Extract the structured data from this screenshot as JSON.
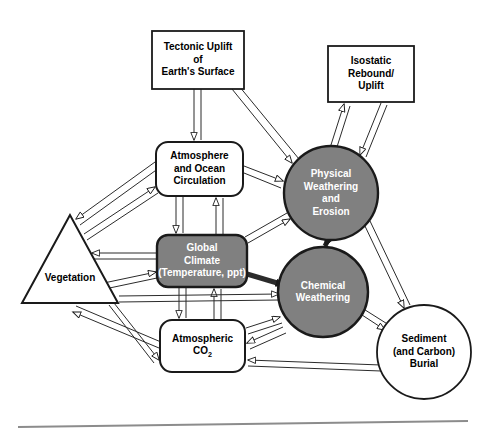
{
  "diagram": {
    "background_color": "#ffffff",
    "stroke_color": "#1a1a1a",
    "fill_shaded": "#808080",
    "fill_plain": "#ffffff",
    "text_light": "#ffffff",
    "text_dark": "#000000",
    "nodes": [
      {
        "id": "tectonic-uplift",
        "name": "tectonic-uplift-box",
        "shape": "rectangle",
        "fill": "#ffffff",
        "text": "Tectonic Uplift\nof\nEarth's Surface",
        "text_color": "#000000",
        "font_size": 10,
        "x": 152,
        "y": 31,
        "w": 92,
        "h": 58
      },
      {
        "id": "isostatic-rebound",
        "name": "isostatic-rebound-box",
        "shape": "rectangle",
        "fill": "#ffffff",
        "text": "Isostatic\nRebound/\nUplift",
        "text_color": "#000000",
        "font_size": 10,
        "x": 328,
        "y": 46,
        "w": 86,
        "h": 56
      },
      {
        "id": "atmosphere-ocean",
        "name": "atmosphere-ocean-circulation-box",
        "shape": "rounded-rectangle",
        "fill": "#ffffff",
        "text": "Atmosphere\nand Ocean\nCirculation",
        "text_color": "#000000",
        "font_size": 10,
        "x": 156,
        "y": 142,
        "w": 87,
        "h": 54
      },
      {
        "id": "global-climate",
        "name": "global-climate-box",
        "shape": "rounded-rectangle",
        "fill": "#808080",
        "text": "Global\nClimate\n(Temperature, ppt)",
        "text_color": "#ffffff",
        "font_size": 10,
        "x": 157,
        "y": 235,
        "w": 90,
        "h": 52
      },
      {
        "id": "atmospheric-co2",
        "name": "atmospheric-co2-box",
        "shape": "rounded-rectangle",
        "fill": "#ffffff",
        "text": "Atmospheric\nCO2",
        "text_color": "#000000",
        "font_size": 10,
        "x": 160,
        "y": 320,
        "w": 85,
        "h": 52
      },
      {
        "id": "physical-weathering",
        "name": "physical-weathering-erosion-circle",
        "shape": "circle",
        "fill": "#808080",
        "text": "Physical\nWeathering\nand\nErosion",
        "text_color": "#ffffff",
        "font_size": 10,
        "cx": 331,
        "cy": 193,
        "r": 47
      },
      {
        "id": "chemical-weathering",
        "name": "chemical-weathering-circle",
        "shape": "circle",
        "fill": "#808080",
        "text": "Chemical\nWeathering",
        "text_color": "#ffffff",
        "font_size": 10,
        "cx": 323,
        "cy": 292,
        "r": 45
      },
      {
        "id": "sediment-burial",
        "name": "sediment-carbon-burial-circle",
        "shape": "circle",
        "fill": "#ffffff",
        "text": "Sediment\n(and Carbon)\nBurial",
        "text_color": "#000000",
        "font_size": 10,
        "cx": 424,
        "cy": 352,
        "r": 47
      },
      {
        "id": "vegetation",
        "name": "vegetation-triangle",
        "shape": "triangle",
        "fill": "#ffffff",
        "text": "Vegetation",
        "text_color": "#000000",
        "font_size": 10,
        "apex_x": 70,
        "apex_y": 215,
        "left_x": 22,
        "left_y": 303,
        "right_x": 118,
        "right_y": 303
      }
    ],
    "edges": [
      {
        "name": "edge-tectonic-to-atmosphere",
        "from": "tectonic-uplift",
        "to": "atmosphere-ocean",
        "style": "double-line",
        "arrow": "end"
      },
      {
        "name": "edge-tectonic-to-physical-weathering",
        "from": "tectonic-uplift",
        "to": "physical-weathering",
        "style": "double-line",
        "arrow": "end"
      },
      {
        "name": "edge-isostatic-to-physical-weathering",
        "from": "isostatic-rebound",
        "to": "physical-weathering",
        "style": "double-line",
        "arrow": "end"
      },
      {
        "name": "edge-physical-weathering-to-isostatic",
        "from": "physical-weathering",
        "to": "isostatic-rebound",
        "style": "double-line",
        "arrow": "end"
      },
      {
        "name": "edge-atmosphere-to-climate",
        "from": "atmosphere-ocean",
        "to": "global-climate",
        "style": "double-line",
        "arrow": "end"
      },
      {
        "name": "edge-climate-to-atmosphere",
        "from": "global-climate",
        "to": "atmosphere-ocean",
        "style": "double-line",
        "arrow": "end"
      },
      {
        "name": "edge-atmosphere-to-physical-weathering",
        "from": "atmosphere-ocean",
        "to": "physical-weathering",
        "style": "double-line",
        "arrow": "end"
      },
      {
        "name": "edge-atmosphere-to-vegetation",
        "from": "atmosphere-ocean",
        "to": "vegetation",
        "style": "double-line",
        "arrow": "end"
      },
      {
        "name": "edge-vegetation-to-atmosphere",
        "from": "vegetation",
        "to": "atmosphere-ocean",
        "style": "double-line",
        "arrow": "end"
      },
      {
        "name": "edge-climate-to-vegetation",
        "from": "global-climate",
        "to": "vegetation",
        "style": "double-line",
        "arrow": "end"
      },
      {
        "name": "edge-vegetation-to-climate",
        "from": "vegetation",
        "to": "global-climate",
        "style": "double-line",
        "arrow": "end"
      },
      {
        "name": "edge-climate-to-physical-weathering",
        "from": "global-climate",
        "to": "physical-weathering",
        "style": "double-line",
        "arrow": "end"
      },
      {
        "name": "edge-climate-to-chemical-weathering",
        "from": "global-climate",
        "to": "chemical-weathering",
        "style": "thick-line",
        "arrow": "end"
      },
      {
        "name": "edge-climate-to-co2",
        "from": "global-climate",
        "to": "atmospheric-co2",
        "style": "double-line",
        "arrow": "end"
      },
      {
        "name": "edge-co2-to-climate",
        "from": "atmospheric-co2",
        "to": "global-climate",
        "style": "double-line",
        "arrow": "end"
      },
      {
        "name": "edge-co2-to-chemical-weathering",
        "from": "atmospheric-co2",
        "to": "chemical-weathering",
        "style": "double-line",
        "arrow": "end"
      },
      {
        "name": "edge-chemical-weathering-to-co2",
        "from": "chemical-weathering",
        "to": "atmospheric-co2",
        "style": "double-line",
        "arrow": "end"
      },
      {
        "name": "edge-co2-to-vegetation",
        "from": "atmospheric-co2",
        "to": "vegetation",
        "style": "double-line",
        "arrow": "end"
      },
      {
        "name": "edge-vegetation-to-co2",
        "from": "vegetation",
        "to": "atmospheric-co2",
        "style": "double-line",
        "arrow": "end"
      },
      {
        "name": "edge-vegetation-to-chemical-weathering",
        "from": "vegetation",
        "to": "chemical-weathering",
        "style": "double-line",
        "arrow": "end"
      },
      {
        "name": "edge-physical-weathering-to-chemical-weathering",
        "from": "physical-weathering",
        "to": "chemical-weathering",
        "style": "thick-line",
        "arrow": "end"
      },
      {
        "name": "edge-physical-weathering-to-sediment",
        "from": "physical-weathering",
        "to": "sediment-burial",
        "style": "double-line",
        "arrow": "end"
      },
      {
        "name": "edge-chemical-weathering-to-sediment",
        "from": "chemical-weathering",
        "to": "sediment-burial",
        "style": "double-line",
        "arrow": "end"
      },
      {
        "name": "edge-sediment-to-co2",
        "from": "sediment-burial",
        "to": "atmospheric-co2",
        "style": "double-line",
        "arrow": "end"
      }
    ],
    "footer_rule": {
      "name": "bottom-divider",
      "visible": true,
      "color": "#8c8c8c"
    }
  }
}
